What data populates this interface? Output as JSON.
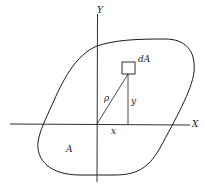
{
  "diagram": {
    "type": "area-moment-of-inertia",
    "labels": {
      "y_axis": "Y",
      "x_axis": "X",
      "element": "dA",
      "radius": "ρ",
      "y_dist": "y",
      "x_dist": "x",
      "area": "A"
    },
    "colors": {
      "stroke": "#1a1a1a",
      "background": "#ffffff"
    }
  }
}
